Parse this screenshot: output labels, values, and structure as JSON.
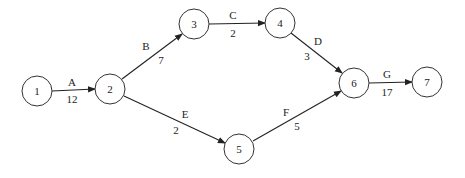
{
  "diagram": {
    "type": "activity-on-arrow network",
    "nodes": [
      {
        "id": "1",
        "label": "1",
        "x": 37,
        "y": 91
      },
      {
        "id": "2",
        "label": "2",
        "x": 110,
        "y": 89
      },
      {
        "id": "3",
        "label": "3",
        "x": 194,
        "y": 24
      },
      {
        "id": "4",
        "label": "4",
        "x": 280,
        "y": 23
      },
      {
        "id": "5",
        "label": "5",
        "x": 239,
        "y": 149
      },
      {
        "id": "6",
        "label": "6",
        "x": 354,
        "y": 83
      },
      {
        "id": "7",
        "label": "7",
        "x": 427,
        "y": 82
      }
    ],
    "edges": [
      {
        "from": "1",
        "to": "2",
        "activity": "A",
        "duration": "12"
      },
      {
        "from": "2",
        "to": "3",
        "activity": "B",
        "duration": "7"
      },
      {
        "from": "3",
        "to": "4",
        "activity": "C",
        "duration": "2"
      },
      {
        "from": "4",
        "to": "6",
        "activity": "D",
        "duration": "3"
      },
      {
        "from": "2",
        "to": "5",
        "activity": "E",
        "duration": "2"
      },
      {
        "from": "5",
        "to": "6",
        "activity": "F",
        "duration": "5"
      },
      {
        "from": "6",
        "to": "7",
        "activity": "G",
        "duration": "17"
      }
    ]
  }
}
